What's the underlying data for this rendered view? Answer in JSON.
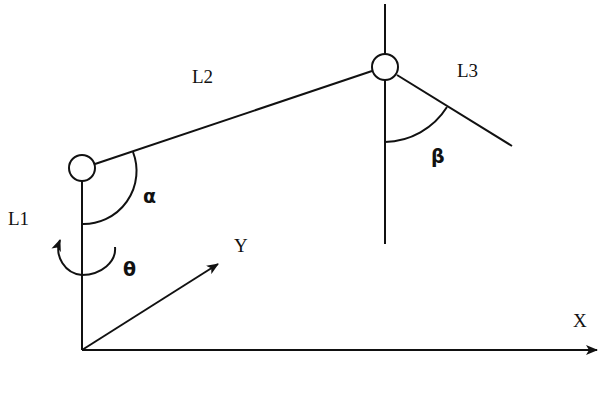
{
  "diagram": {
    "title": "",
    "type": "robot-arm-kinematics",
    "links": [
      {
        "id": "L1",
        "label": "L1"
      },
      {
        "id": "L2",
        "label": "L2"
      },
      {
        "id": "L3",
        "label": "L3"
      }
    ],
    "angles": [
      {
        "id": "theta",
        "symbol": "θ"
      },
      {
        "id": "alpha",
        "symbol": "α"
      },
      {
        "id": "beta",
        "symbol": "β"
      }
    ],
    "axes": {
      "x": {
        "label": "X"
      },
      "y": {
        "label": "Y"
      }
    },
    "colors": {
      "stroke": "#111111",
      "background": "#ffffff"
    }
  }
}
